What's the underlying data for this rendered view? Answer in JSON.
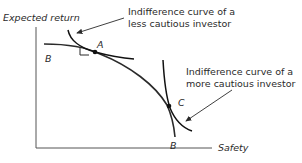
{
  "diagram": {
    "y_axis_label": "Expected return",
    "x_axis_label": "Safety",
    "curve_label_start": "B",
    "curve_label_end": "B",
    "point_a": "A",
    "point_c": "C",
    "annotation_less_cautious": {
      "line1": "Indifference curve of a",
      "line2": "less cautious investor"
    },
    "annotation_more_cautious": {
      "line1": "Indifference curve of a",
      "line2": "more cautious investor"
    },
    "colors": {
      "line": "#2a2a2a",
      "text": "#2a2a2a",
      "background": "#ffffff"
    }
  }
}
